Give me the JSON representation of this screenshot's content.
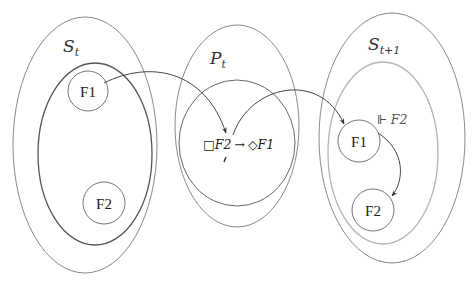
{
  "diagram": {
    "sets": [
      {
        "id": "S_t",
        "label_main": "S",
        "label_sub": "t",
        "style": "script"
      },
      {
        "id": "P_t",
        "label_main": "P",
        "label_sub": "t",
        "style": "script"
      },
      {
        "id": "S_t1",
        "label_main": "S",
        "label_sub": "t+1",
        "style": "script"
      }
    ],
    "nodes": {
      "left_f1": "F1",
      "left_f2": "F2",
      "right_f1": "F1",
      "right_f2": "F2"
    },
    "formula": {
      "box": "□",
      "lhs": "F2",
      "arrow": "→",
      "diamond": "◇",
      "rhs": "F1"
    },
    "satisfaction": {
      "symbol": "⊩",
      "formula": "F2"
    },
    "colors": {
      "outer_ellipse": "#8a8a8a",
      "inner_left": "#555555",
      "inner_right": "#b5b5b5",
      "arrow": "#444444",
      "node": "#777777"
    }
  }
}
